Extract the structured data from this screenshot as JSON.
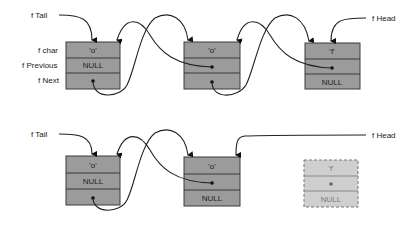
{
  "diagram": {
    "top_list": {
      "tail_label": "f Tail",
      "head_label": "f Head",
      "field_labels": {
        "char": "f char",
        "previous": "f Previous",
        "next": "f Next"
      },
      "nodes": [
        {
          "char": "'o'",
          "previous": "NULL",
          "next": ""
        },
        {
          "char": "'o'",
          "previous": "",
          "next": ""
        },
        {
          "char": "'f'",
          "previous": "",
          "next": "NULL"
        }
      ]
    },
    "bottom_list": {
      "tail_label": "f Tail",
      "head_label": "f Head",
      "nodes": [
        {
          "char": "'o'",
          "previous": "NULL",
          "next": ""
        },
        {
          "char": "'o'",
          "previous": "",
          "next": "NULL"
        }
      ],
      "removed_node": {
        "char": "'f'",
        "previous": "",
        "next": "NULL"
      }
    },
    "colors": {
      "node_fill": "#9b9b9b",
      "node_border": "#3a3a3a",
      "removed_fill": "#cfcfcf",
      "removed_border": "#777777",
      "arrow": "#222222"
    }
  }
}
